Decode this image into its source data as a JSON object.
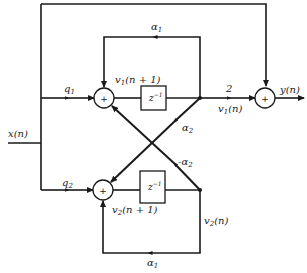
{
  "diagram": {
    "type": "signal-flow / block diagram (coupled form digital filter)",
    "input_label": "x(n)",
    "output_label": "y(n)",
    "upper_branch": {
      "input_gain": "q1",
      "adder_label": "+",
      "state_next": "v1(n + 1)",
      "delay_label": "z⁻¹",
      "state": "v1(n)",
      "feedback_gain": "α1",
      "output_gain": "2"
    },
    "lower_branch": {
      "input_gain": "q2",
      "adder_label": "+",
      "state_next": "v2(n + 1)",
      "delay_label": "z⁻¹",
      "state": "v2(n)",
      "feedback_gain": "α1"
    },
    "cross_gains": {
      "v1_to_lower": "α2",
      "v2_to_upper": "-α2"
    },
    "output_adder_label": "+"
  },
  "labels": {
    "x": "x(n)",
    "y": "y(n)",
    "q1": "q",
    "q1_sub": "1",
    "q2": "q",
    "q2_sub": "2",
    "alpha_top": "α",
    "alpha_top_sub": "1",
    "alpha_bottom": "α",
    "alpha_bottom_sub": "1",
    "alpha2": "α",
    "alpha2_sub": "2",
    "neg_alpha2": "-α",
    "neg_alpha2_sub": "2",
    "v1_next_a": "v",
    "v1_next_sub": "1",
    "v1_next_b": "(n + 1)",
    "v2_next_a": "v",
    "v2_next_sub": "2",
    "v2_next_b": "(n + 1)",
    "v1_a": "v",
    "v1_sub": "1",
    "v1_b": "(n)",
    "v2_a": "v",
    "v2_sub": "2",
    "v2_b": "(n)",
    "gain_two": "2",
    "plus": "+",
    "z": "z",
    "z_exp": "−1"
  }
}
